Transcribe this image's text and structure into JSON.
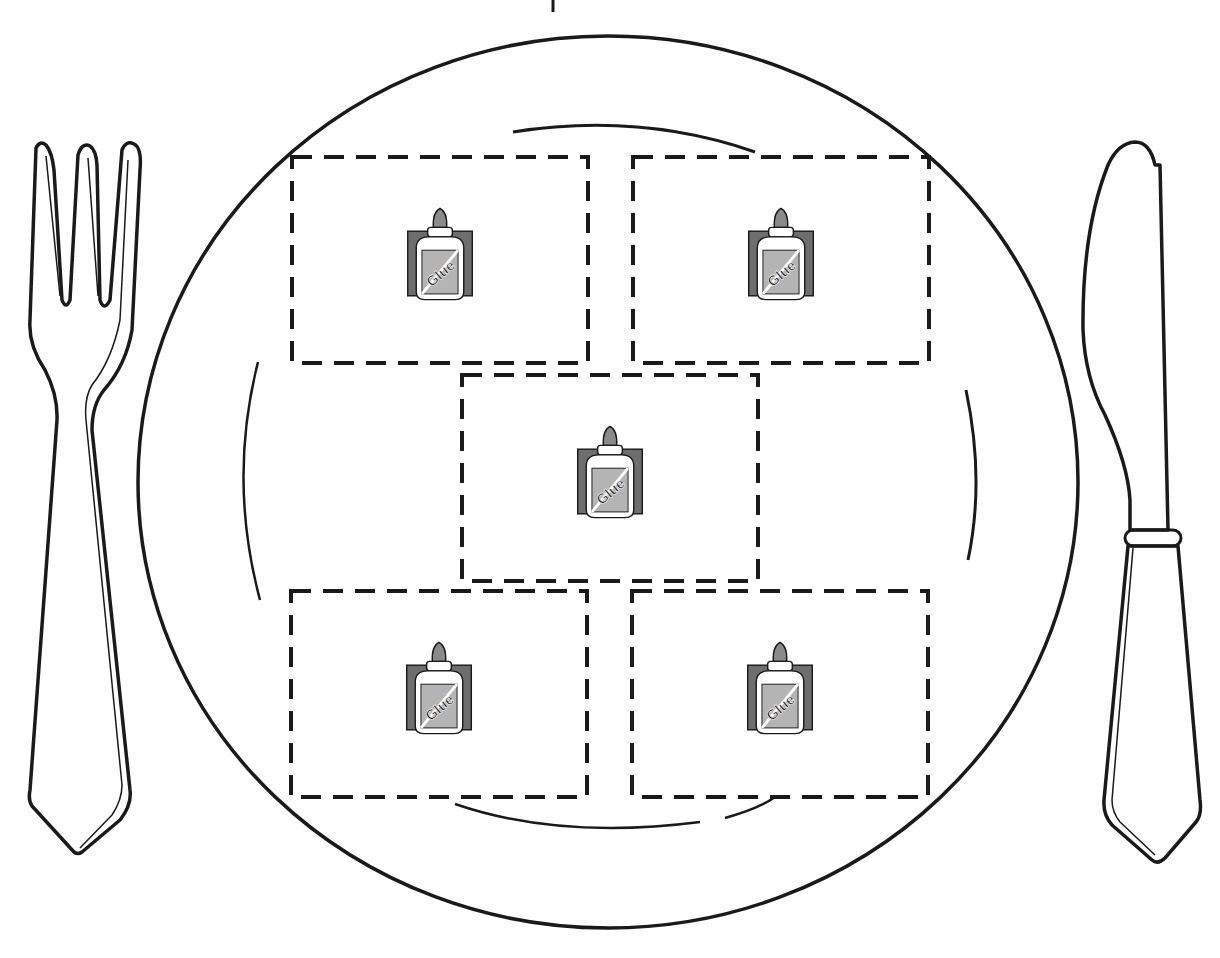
{
  "worksheet": {
    "title": "Place setting glue activity",
    "plate": {
      "glue_zone_count": 5
    },
    "glue_zones": [
      {
        "id": "top-left",
        "icon": "glue-bottle-icon",
        "label": "Glue"
      },
      {
        "id": "top-right",
        "icon": "glue-bottle-icon",
        "label": "Glue"
      },
      {
        "id": "center",
        "icon": "glue-bottle-icon",
        "label": "Glue"
      },
      {
        "id": "bottom-left",
        "icon": "glue-bottle-icon",
        "label": "Glue"
      },
      {
        "id": "bottom-right",
        "icon": "glue-bottle-icon",
        "label": "Glue"
      }
    ],
    "utensils": {
      "left": "fork",
      "right": "knife"
    },
    "colors": {
      "line": "#1a1a1a",
      "icon_bg": "#6e6e6e",
      "icon_label": "#b4b4b4",
      "cap": "#8a8a8a",
      "paper": "#ffffff"
    }
  }
}
